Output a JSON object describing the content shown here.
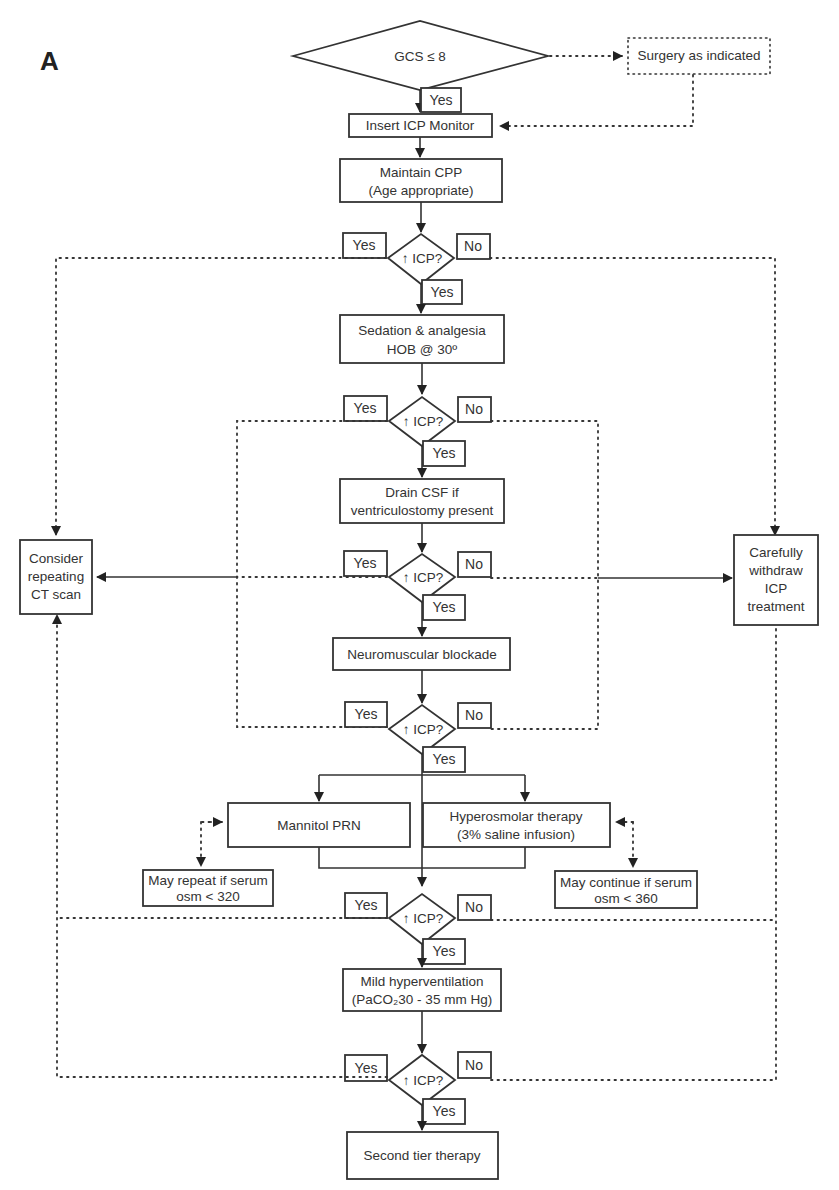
{
  "figure": {
    "panel_label": "A",
    "start": {
      "label": "GCS ≤ 8"
    },
    "surgery": {
      "label": "Surgery as indicated"
    },
    "insert_icp": {
      "label": "Insert ICP Monitor"
    },
    "maintain_cpp": {
      "line1": "Maintain CPP",
      "line2": "(Age appropriate)"
    },
    "sedation": {
      "line1": "Sedation & analgesia",
      "line2": "HOB @ 30º"
    },
    "drain_csf": {
      "line1": "Drain CSF if",
      "line2": "ventriculostomy present"
    },
    "neuromuscular": {
      "label": "Neuromuscular blockade"
    },
    "mannitol": {
      "label": "Mannitol PRN"
    },
    "hyperosmolar": {
      "line1": "Hyperosmolar therapy",
      "line2": "(3% saline infusion)"
    },
    "may_repeat": {
      "line1": "May repeat if serum",
      "line2": "osm < 320"
    },
    "may_continue": {
      "line1": "May continue if serum",
      "line2": "osm < 360"
    },
    "hyperventilation": {
      "line1": "Mild hyperventilation",
      "line2": "(PaCO₂30 - 35 mm Hg)"
    },
    "second_tier": {
      "label": "Second tier therapy"
    },
    "consider_ct": {
      "line1": "Consider",
      "line2": "repeating",
      "line3": "CT scan"
    },
    "withdraw": {
      "line1": "Carefully",
      "line2": "withdraw",
      "line3": "ICP",
      "line4": "treatment"
    },
    "decision": {
      "label": "↑ ICP?"
    },
    "yes": "Yes",
    "no": "No"
  }
}
